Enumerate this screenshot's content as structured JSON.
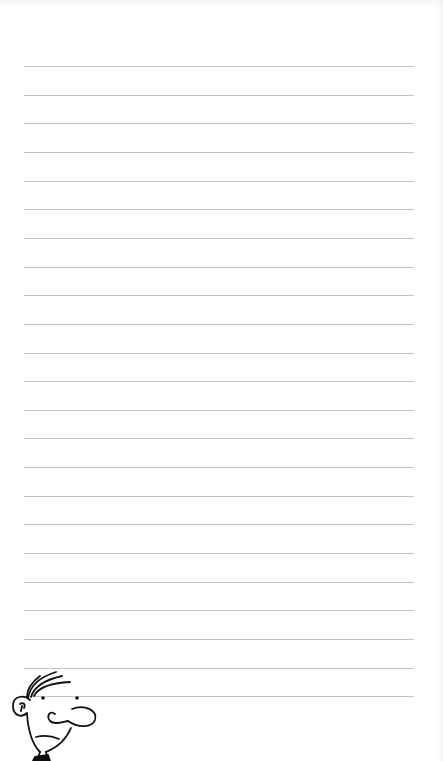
{
  "page": {
    "type": "lined-notebook-page",
    "background_color": "#ffffff",
    "line_color": "#c4c4c4",
    "line_count": 23,
    "first_line_y": 66,
    "line_spacing": 28.65,
    "line_left_x": 24,
    "line_right_x": 414
  },
  "doodle": {
    "name": "cartoon-face",
    "stroke_color": "#111111",
    "position": "bottom-left"
  }
}
